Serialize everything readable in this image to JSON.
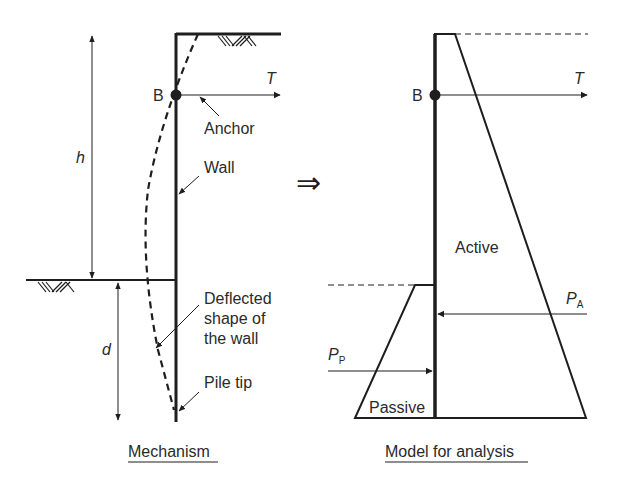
{
  "left_panel": {
    "caption": "Mechanism",
    "labels": {
      "h": "h",
      "d": "d",
      "B": "B",
      "T": "T",
      "anchor": "Anchor",
      "wall": "Wall",
      "deflected_1": "Deflected",
      "deflected_2": "shape of",
      "deflected_3": "the wall",
      "pile_tip": "Pile tip"
    }
  },
  "transition_symbol": "⇒",
  "right_panel": {
    "caption": "Model for analysis",
    "labels": {
      "B": "B",
      "T": "T",
      "active": "Active",
      "passive": "Passive",
      "PA_main": "P",
      "PA_sub": "A",
      "PP_main": "P",
      "PP_sub": "P"
    }
  },
  "colors": {
    "ink": "#1e1e1e",
    "background": "#ffffff"
  }
}
